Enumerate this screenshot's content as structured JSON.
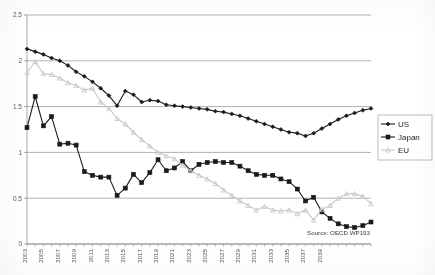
{
  "chart_data": {
    "type": "line",
    "title": "",
    "subtitle": "",
    "xlabel": "",
    "ylabel": "",
    "ylim": [
      0,
      2.5
    ],
    "yticks": [
      "0",
      "0.5",
      "1",
      "1.5",
      "2",
      "2.5"
    ],
    "ytick_values": [
      0,
      0.5,
      1,
      1.5,
      2,
      2.5
    ],
    "grid": "horizontal",
    "legend_position": "right",
    "x": [
      2003,
      2004,
      2005,
      2006,
      2007,
      2008,
      2009,
      2010,
      2011,
      2012,
      2013,
      2014,
      2015,
      2016,
      2017,
      2018,
      2019,
      2020,
      2021,
      2022,
      2023,
      2024,
      2025,
      2026,
      2027,
      2028,
      2029,
      2030,
      2031,
      2032,
      2033,
      2034,
      2035,
      2036,
      2037,
      2038,
      2039,
      2040
    ],
    "xtick_labels": [
      "2003",
      "2005",
      "2007",
      "2009",
      "2011",
      "2013",
      "2015",
      "2017",
      "2019",
      "2021",
      "2023",
      "2025",
      "2027",
      "2029",
      "2031",
      "2033",
      "2035",
      "2037",
      "2039"
    ],
    "series": [
      {
        "name": "US",
        "color": "#1a1a1a",
        "marker": "diamond",
        "values": [
          2.13,
          2.1,
          2.07,
          2.03,
          2.0,
          1.95,
          1.88,
          1.83,
          1.77,
          1.7,
          1.62,
          1.51,
          1.67,
          1.63,
          1.55,
          1.57,
          1.56,
          1.52,
          1.51,
          1.5,
          1.49,
          1.48,
          1.47,
          1.45,
          1.44,
          1.42,
          1.4,
          1.37,
          1.34,
          1.31,
          1.28,
          1.25,
          1.22,
          1.21,
          1.18,
          1.21,
          1.26,
          1.31
        ]
      },
      {
        "name": "Japan",
        "color": "#1a1a1a",
        "marker": "square",
        "values": [
          1.27,
          1.61,
          1.29,
          1.39,
          1.09,
          1.1,
          1.08,
          0.79,
          0.75,
          0.73,
          0.73,
          0.53,
          0.61,
          0.76,
          0.67,
          0.78,
          0.92,
          0.8,
          0.83,
          0.9,
          0.8,
          0.87,
          0.89,
          0.9,
          0.89,
          0.89,
          0.85,
          0.8,
          0.76,
          0.75,
          0.75,
          0.71,
          0.68,
          0.6,
          0.47,
          0.51,
          0.35,
          0.28
        ]
      },
      {
        "name": "EU",
        "color": "#c8c8c8",
        "marker": "triangle",
        "values": [
          1.87,
          1.99,
          1.86,
          1.85,
          1.81,
          1.76,
          1.73,
          1.68,
          1.7,
          1.55,
          1.48,
          1.37,
          1.31,
          1.22,
          1.14,
          1.07,
          1.0,
          0.96,
          0.93,
          0.86,
          0.8,
          0.75,
          0.71,
          0.66,
          0.59,
          0.53,
          0.47,
          0.42,
          0.37,
          0.41,
          0.37,
          0.36,
          0.37,
          0.33,
          0.37,
          0.26,
          0.38,
          0.42
        ]
      }
    ],
    "series_tail": {
      "note_x": [
        2041,
        2042,
        2043,
        2044,
        2045
      ],
      "US": [
        1.36,
        1.4,
        1.43,
        1.46,
        1.48
      ],
      "Japan": [
        0.22,
        0.19,
        0.18,
        0.2,
        0.24
      ],
      "EU": [
        0.5,
        0.55,
        0.55,
        0.52,
        0.44
      ]
    },
    "annotations": [
      {
        "name": "source",
        "text": "Source: OECD WP193"
      }
    ]
  },
  "legend": {
    "items": [
      {
        "label": "US",
        "color": "#1a1a1a",
        "marker": "diamond"
      },
      {
        "label": "Japan",
        "color": "#1a1a1a",
        "marker": "square"
      },
      {
        "label": "EU",
        "color": "#c8c8c8",
        "marker": "triangle"
      }
    ]
  },
  "axes": {
    "y_labels": [
      "2.5",
      "2",
      "1.5",
      "1",
      "0.5",
      "0"
    ],
    "x_labels": [
      "2003",
      "2005",
      "2007",
      "2009",
      "2011",
      "2013",
      "2015",
      "2017",
      "2019",
      "2021",
      "2023",
      "2025",
      "2027",
      "2029",
      "2031",
      "2033",
      "2035",
      "2037",
      "2039"
    ]
  },
  "source_text": "Source: OECD WP193"
}
